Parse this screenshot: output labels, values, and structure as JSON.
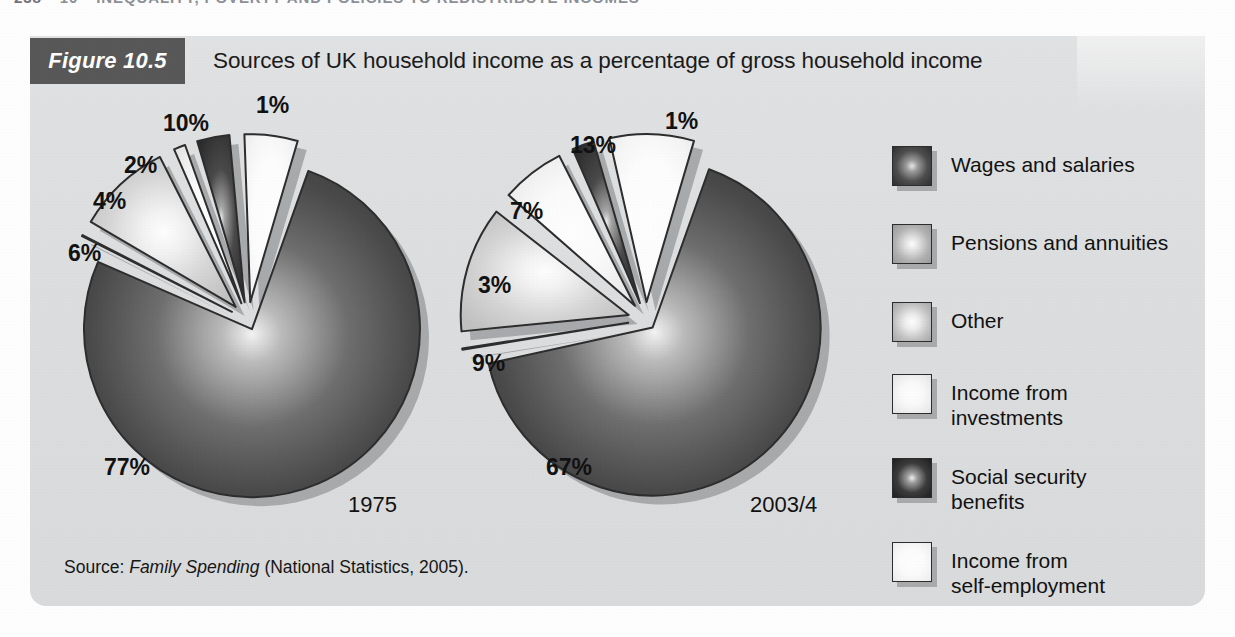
{
  "running_header": {
    "page_number": "238",
    "chapter_number": "10",
    "chapter_title": "INEQUALITY, POVERTY AND POLICIES TO REDISTRIBUTE INCOMES"
  },
  "figure": {
    "badge": "Figure 10.5",
    "title": "Sources of UK household income as a percentage of gross household income",
    "source_prefix": "Source: ",
    "source_italic": "Family Spending",
    "source_suffix": " (National Statistics, 2005)."
  },
  "colors": {
    "panel_background": "#dedfe0",
    "badge_background": "#585858",
    "badge_text": "#ffffff",
    "text": "#111111",
    "slice_outline": "#2d2d2d",
    "shadow": "#9fa1a3"
  },
  "legend": {
    "items": [
      {
        "label": "Wages and salaries",
        "swatch": "dark-gradient-swatch",
        "tone": "dark"
      },
      {
        "label": "Pensions and annuities",
        "swatch": "mid-gradient-swatch",
        "tone": "mid"
      },
      {
        "label": "Other",
        "swatch": "mid-light-gradient-swatch",
        "tone": "midlight"
      },
      {
        "label": "Income from\ninvestments",
        "swatch": "light-gradient-swatch",
        "tone": "light"
      },
      {
        "label": "Social security\nbenefits",
        "swatch": "darkest-gradient-swatch",
        "tone": "darkest"
      },
      {
        "label": "Income from\nself-employment",
        "swatch": "lightest-gradient-swatch",
        "tone": "lightest"
      }
    ]
  },
  "chart_data": {
    "type": "pie",
    "title": "Sources of UK household income as a percentage of gross household income",
    "unit": "%",
    "legend_position": "right",
    "categories": [
      "Wages and salaries",
      "Pensions and annuities",
      "Other",
      "Income from investments",
      "Social security benefits",
      "Income from self-employment"
    ],
    "charts": [
      {
        "name": "1975",
        "label": "1975",
        "values": [
          77,
          1,
          10,
          2,
          4,
          6
        ],
        "labels": [
          "77%",
          "1%",
          "10%",
          "2%",
          "4%",
          "6%"
        ]
      },
      {
        "name": "2003/4",
        "label": "2003/4",
        "values": [
          67,
          1,
          13,
          7,
          3,
          9
        ],
        "labels": [
          "67%",
          "1%",
          "13%",
          "7%",
          "3%",
          "9%"
        ]
      }
    ]
  }
}
